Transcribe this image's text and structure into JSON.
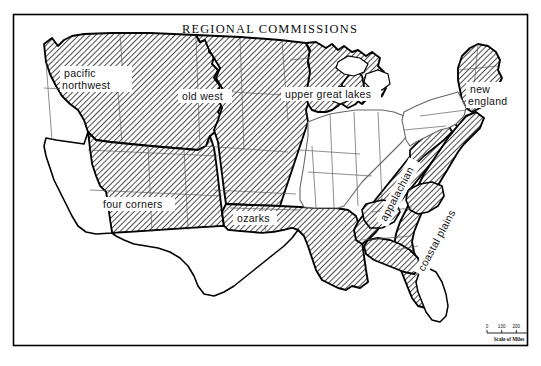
{
  "figure": {
    "title": "REGIONAL COMMISSIONS",
    "frame": {
      "x": 13,
      "y": 14,
      "width": 515,
      "height": 332
    },
    "background_color": "#ffffff",
    "shaded_fill_color": "#000000",
    "shaded_pattern": "diagonal-hatch",
    "region_outline_color": "#000000",
    "state_outline_color": "#555555",
    "coastline_color": "#000000"
  },
  "map": {
    "map_name": "united-states-regional-commissions",
    "projection_note": "contiguous united states",
    "regions": [
      {
        "id": "pacific-northwest",
        "label": "pacific northwest",
        "label_x": 68,
        "label_y": 72,
        "shaded": true,
        "multiline": true,
        "lines": [
          "pacific",
          "northwest"
        ]
      },
      {
        "id": "old-west",
        "label": "old west",
        "label_x": 183,
        "label_y": 97,
        "shaded": true,
        "multiline": false,
        "lines": [
          "old west"
        ]
      },
      {
        "id": "upper-great-lakes",
        "label": "upper great lakes",
        "label_x": 286,
        "label_y": 95,
        "shaded": true,
        "multiline": false,
        "lines": [
          "upper great lakes"
        ]
      },
      {
        "id": "new-england",
        "label": "new england",
        "label_x": 470,
        "label_y": 91,
        "shaded": true,
        "multiline": true,
        "lines": [
          "new",
          "england"
        ]
      },
      {
        "id": "four-corners",
        "label": "four corners",
        "label_x": 103,
        "label_y": 205,
        "shaded": true,
        "multiline": false,
        "lines": [
          "four corners"
        ]
      },
      {
        "id": "ozarks",
        "label": "ozarks",
        "label_x": 237,
        "label_y": 219,
        "shaded": true,
        "multiline": false,
        "lines": [
          "ozarks"
        ]
      },
      {
        "id": "appalachian",
        "label": "appalachian",
        "label_x": 404,
        "label_y": 196,
        "shaded": true,
        "rotated": true,
        "rotation_deg": -62,
        "lines": [
          "appalachian"
        ]
      },
      {
        "id": "coastal-plains",
        "label": "coastal plains",
        "label_x": 446,
        "label_y": 244,
        "shaded": true,
        "rotated": true,
        "rotation_deg": -62,
        "lines": [
          "coastal plains"
        ]
      }
    ],
    "unshaded_area_note": "california, nevada, texas, midwest interior and florida interior are unshaded"
  },
  "scale_bar": {
    "caption": "Scale of Miles",
    "ticks": [
      "0",
      "100",
      "200",
      "300"
    ],
    "x": 487,
    "y": 330,
    "width": 44
  }
}
